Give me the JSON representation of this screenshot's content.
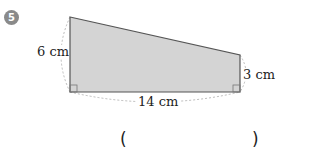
{
  "problem": {
    "number": "5",
    "shape": "right trapezoid",
    "labels": {
      "left_side": "6 cm",
      "right_side": "3 cm",
      "bottom_side": "14 cm"
    },
    "answer": {
      "open_paren": "(",
      "close_paren": ")",
      "value": ""
    }
  },
  "colors": {
    "fill": "#d4d4d4",
    "stroke": "#555555",
    "badge": "#8a8a8a"
  }
}
